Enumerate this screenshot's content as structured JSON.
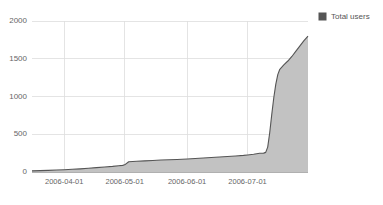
{
  "chart_data": {
    "type": "area",
    "title": "",
    "xlabel": "",
    "ylabel": "",
    "legend_position": "top-right",
    "grid": true,
    "ylim": [
      0,
      2000
    ],
    "yticks": [
      0,
      500,
      1000,
      1500,
      2000
    ],
    "ytick_labels": [
      "0",
      "500",
      "1000",
      "1500",
      "2000"
    ],
    "xticks": [
      "2006-04-01",
      "2006-05-01",
      "2006-06-01",
      "2006-07-01"
    ],
    "xtick_labels": [
      "2006-04-01",
      "2006-05-01",
      "2006-06-01",
      "2006-07-01"
    ],
    "xlim": [
      "2006-03-16",
      "2006-07-31"
    ],
    "series": [
      {
        "name": "Total users",
        "color": "#555555",
        "fill_color": "#c2c2c2",
        "x": [
          "2006-03-16",
          "2006-03-20",
          "2006-03-24",
          "2006-03-28",
          "2006-04-01",
          "2006-04-05",
          "2006-04-09",
          "2006-04-13",
          "2006-04-17",
          "2006-04-21",
          "2006-04-25",
          "2006-04-28",
          "2006-04-30",
          "2006-05-01",
          "2006-05-03",
          "2006-05-07",
          "2006-05-11",
          "2006-05-15",
          "2006-05-19",
          "2006-05-23",
          "2006-05-27",
          "2006-06-01",
          "2006-06-05",
          "2006-06-09",
          "2006-06-13",
          "2006-06-17",
          "2006-06-21",
          "2006-06-25",
          "2006-06-29",
          "2006-07-01",
          "2006-07-04",
          "2006-07-07",
          "2006-07-09",
          "2006-07-10",
          "2006-07-11",
          "2006-07-12",
          "2006-07-13",
          "2006-07-14",
          "2006-07-15",
          "2006-07-16",
          "2006-07-17",
          "2006-07-19",
          "2006-07-21",
          "2006-07-23",
          "2006-07-25",
          "2006-07-27",
          "2006-07-29",
          "2006-07-31"
        ],
        "values": [
          15,
          18,
          22,
          26,
          30,
          36,
          42,
          50,
          58,
          66,
          74,
          82,
          88,
          95,
          135,
          142,
          148,
          153,
          158,
          162,
          166,
          172,
          178,
          185,
          192,
          198,
          205,
          212,
          220,
          226,
          235,
          248,
          250,
          260,
          330,
          520,
          760,
          980,
          1160,
          1290,
          1360,
          1420,
          1470,
          1530,
          1600,
          1670,
          1740,
          1800
        ]
      }
    ],
    "legend": [
      {
        "label": "Total users",
        "color": "#555555"
      }
    ]
  }
}
